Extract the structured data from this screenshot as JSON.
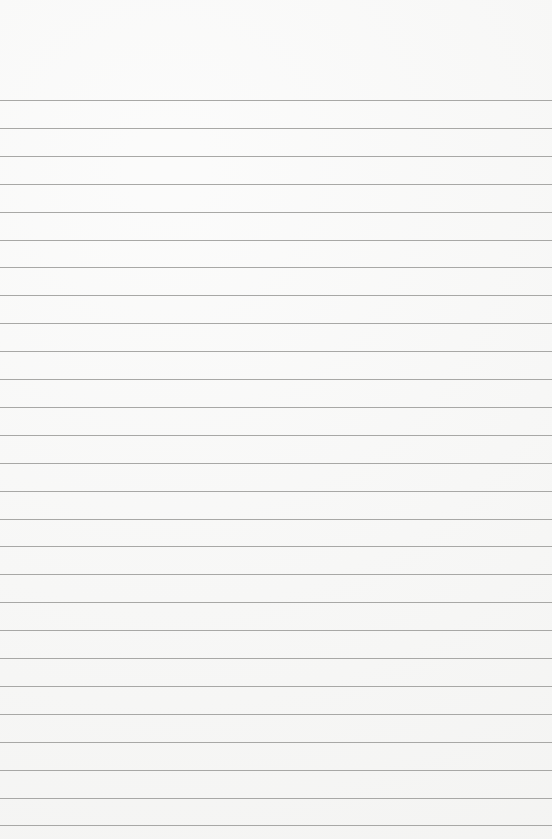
{
  "paper": {
    "type": "lined-paper",
    "background_color": "#f6f6f5",
    "line_color": "#a8a8a6",
    "first_line_y": 100,
    "line_spacing": 27.9,
    "line_count": 27
  }
}
